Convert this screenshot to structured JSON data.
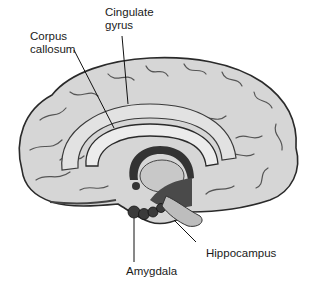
{
  "diagram": {
    "labels": [
      {
        "id": "cingulate",
        "line1": "Cingulate",
        "line2": "gyrus"
      },
      {
        "id": "corpus",
        "line1": "Corpus",
        "line2": "callosum"
      },
      {
        "id": "hippocampus",
        "text": "Hippocampus"
      },
      {
        "id": "amygdala",
        "text": "Amygdala"
      }
    ]
  },
  "colors": {
    "background": "#ffffff",
    "brain_fill": "#d9d9d9",
    "outline": "#2a2a2a",
    "dark_structure": "#3a3a3a"
  }
}
